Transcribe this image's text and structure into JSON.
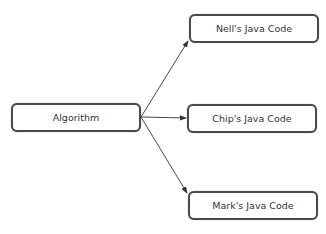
{
  "diagram": {
    "source": {
      "id": "algorithm",
      "label": "Algorithm"
    },
    "targets": [
      {
        "id": "nell",
        "label": "Nell's Java Code"
      },
      {
        "id": "chip",
        "label": "Chip's Java Code"
      },
      {
        "id": "mark",
        "label": "Mark's Java Code"
      }
    ],
    "edges": [
      {
        "from": "algorithm",
        "to": "nell"
      },
      {
        "from": "algorithm",
        "to": "chip"
      },
      {
        "from": "algorithm",
        "to": "mark"
      }
    ],
    "colors": {
      "border": "#4a4a4a",
      "arrow": "#333333",
      "text": "#333333"
    }
  }
}
